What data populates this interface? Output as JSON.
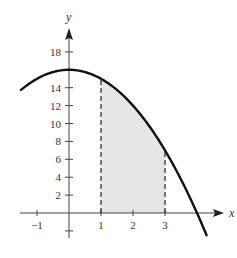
{
  "chart_data": {
    "type": "area",
    "title": "",
    "function": "f(x) = 16 - x^2",
    "xlabel": "x",
    "ylabel": "y",
    "xlim": [
      -1.5,
      4.3
    ],
    "ylim": [
      -3,
      19
    ],
    "x_ticks": [
      -1,
      1,
      2,
      3
    ],
    "x_tick_labels": [
      "−1",
      "1",
      "2",
      "3"
    ],
    "y_ticks": [
      2,
      4,
      6,
      8,
      10,
      12,
      14,
      18
    ],
    "y_tick_labels": [
      "2",
      "4",
      "6",
      "8",
      "10",
      "12",
      "14",
      "18"
    ],
    "shaded_region": {
      "from": 1,
      "to": 3,
      "under": "f(x)"
    },
    "dashed_lines": [
      {
        "x": 1,
        "y": 15
      },
      {
        "x": 3,
        "y": 7
      }
    ],
    "curve_points": [
      {
        "x": -1.5,
        "y": 13.75
      },
      {
        "x": -1,
        "y": 15
      },
      {
        "x": 0,
        "y": 16
      },
      {
        "x": 1,
        "y": 15
      },
      {
        "x": 2,
        "y": 12
      },
      {
        "x": 3,
        "y": 7
      },
      {
        "x": 4,
        "y": 0
      },
      {
        "x": 4.3,
        "y": -2.49
      }
    ],
    "grid": false,
    "colors": {
      "curve": "#111111",
      "axis": "#444444",
      "shade": "#e6e6e6",
      "dash": "#222222"
    }
  }
}
